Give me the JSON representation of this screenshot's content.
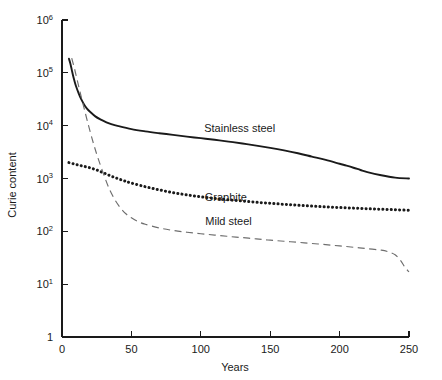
{
  "chart_data": {
    "type": "line",
    "title": "",
    "xlabel": "Years",
    "ylabel": "Curie content",
    "xlim": [
      0,
      250
    ],
    "ylim": [
      1,
      1000000
    ],
    "yscale": "log",
    "grid": false,
    "legend_position": "inline-annotations",
    "xticks": [
      "0",
      "50",
      "100",
      "150",
      "200",
      "250"
    ],
    "xtick_values": [
      0,
      50,
      100,
      150,
      200,
      250
    ],
    "yticks": [
      "1",
      "10",
      "10",
      "10",
      "10",
      "10"
    ],
    "ytick_values": [
      1,
      10,
      100,
      1000,
      10000,
      100000,
      1000000
    ],
    "ytick_labels": [
      {
        "mantissa": "10",
        "exponent": "6",
        "value": 1000000
      },
      {
        "mantissa": "10",
        "exponent": "5",
        "value": 100000
      },
      {
        "mantissa": "10",
        "exponent": "4",
        "value": 10000
      },
      {
        "mantissa": "10",
        "exponent": "3",
        "value": 1000
      },
      {
        "mantissa": "10",
        "exponent": "2",
        "value": 100
      },
      {
        "mantissa": "10",
        "exponent": "1",
        "value": 10
      },
      {
        "mantissa": "1",
        "exponent": "",
        "value": 1
      }
    ],
    "series": [
      {
        "name": "Stainless steel",
        "style": "solid",
        "color": "#1a1a1a",
        "label_x": 128,
        "label_y": 9000,
        "x": [
          5,
          6,
          7,
          8,
          9,
          10,
          12,
          14,
          16,
          18,
          20,
          24,
          28,
          32,
          36,
          40,
          50,
          60,
          70,
          80,
          90,
          100,
          110,
          120,
          130,
          140,
          150,
          160,
          170,
          180,
          190,
          200,
          205,
          210,
          215,
          220,
          230,
          240,
          250
        ],
        "y": [
          185000,
          150000,
          115000,
          88000,
          70000,
          57000,
          41000,
          31000,
          25000,
          21000,
          18500,
          15000,
          13000,
          11600,
          10600,
          9900,
          8600,
          7800,
          7200,
          6700,
          6200,
          5800,
          5400,
          5000,
          4600,
          4200,
          3800,
          3400,
          3000,
          2600,
          2250,
          1900,
          1750,
          1600,
          1450,
          1320,
          1150,
          1040,
          1000
        ]
      },
      {
        "name": "Graphite",
        "style": "dotted",
        "color": "#1a1a1a",
        "label_x": 118,
        "label_y": 440,
        "x": [
          5,
          10,
          15,
          20,
          25,
          30,
          35,
          40,
          45,
          50,
          60,
          70,
          80,
          90,
          100,
          110,
          120,
          130,
          140,
          150,
          160,
          170,
          180,
          190,
          200,
          210,
          220,
          230,
          240,
          250
        ],
        "y": [
          2000,
          1850,
          1720,
          1600,
          1450,
          1280,
          1120,
          1000,
          900,
          820,
          700,
          610,
          540,
          490,
          450,
          420,
          395,
          375,
          355,
          340,
          325,
          312,
          300,
          290,
          282,
          275,
          268,
          262,
          256,
          250
        ]
      },
      {
        "name": "Mild steel",
        "style": "dashed",
        "color": "#6e6e6e",
        "label_x": 120,
        "label_y": 160,
        "x": [
          7,
          9,
          11,
          14,
          17,
          20,
          23,
          26,
          30,
          34,
          38,
          42,
          46,
          50,
          55,
          60,
          70,
          80,
          90,
          100,
          110,
          120,
          130,
          140,
          150,
          160,
          170,
          180,
          190,
          200,
          210,
          220,
          230,
          235,
          240,
          244,
          247,
          250
        ],
        "y": [
          190000,
          120000,
          72000,
          34000,
          16500,
          8200,
          4300,
          2400,
          1200,
          640,
          400,
          280,
          215,
          180,
          152,
          136,
          116,
          104,
          96,
          90,
          85,
          80,
          76,
          72,
          68,
          65,
          62,
          59,
          56,
          53,
          50,
          47,
          44,
          41,
          36,
          28,
          21,
          17
        ]
      }
    ]
  }
}
